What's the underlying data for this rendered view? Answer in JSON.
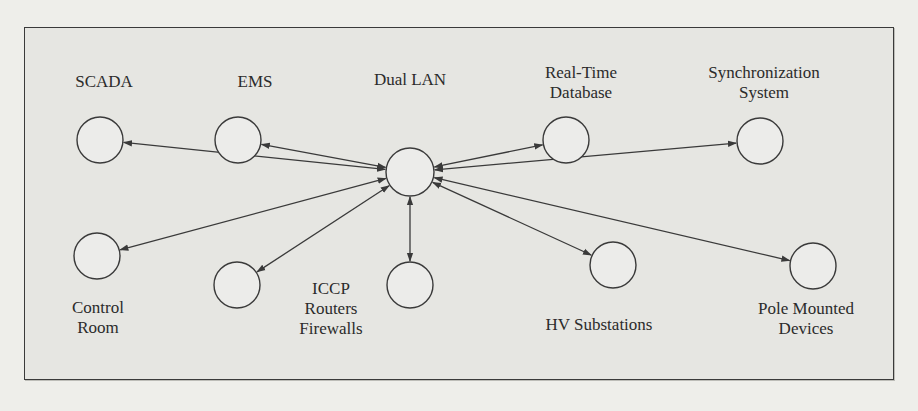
{
  "diagram": {
    "type": "network-star",
    "hub": {
      "id": "dual-lan",
      "label": "Dual LAN",
      "cx": 410,
      "cy": 172,
      "r": 24,
      "label_x": 410,
      "label_y": 70
    },
    "nodes": [
      {
        "id": "scada",
        "label": "SCADA",
        "cx": 100,
        "cy": 140,
        "r": 23,
        "label_x": 104,
        "label_y": 72
      },
      {
        "id": "ems",
        "label": "EMS",
        "cx": 238,
        "cy": 140,
        "r": 23,
        "label_x": 255,
        "label_y": 72
      },
      {
        "id": "real-time-database",
        "label": "Real-Time\nDatabase",
        "cx": 566,
        "cy": 140,
        "r": 23,
        "label_x": 581,
        "label_y": 63
      },
      {
        "id": "synchronization-system",
        "label": "Synchronization\nSystem",
        "cx": 760,
        "cy": 141,
        "r": 23,
        "label_x": 764,
        "label_y": 63
      },
      {
        "id": "control-room",
        "label": "Control\nRoom",
        "cx": 97,
        "cy": 256,
        "r": 23,
        "label_x": 98,
        "label_y": 298
      },
      {
        "id": "iccp-left",
        "label": "",
        "cx": 237,
        "cy": 285,
        "r": 23,
        "label_x": 237,
        "label_y": 0
      },
      {
        "id": "iccp-routers-firewalls",
        "label": "ICCP\nRouters\nFirewalls",
        "cx": 410,
        "cy": 285,
        "r": 23,
        "label_x": 331,
        "label_y": 279
      },
      {
        "id": "hv-substations",
        "label": "HV Substations",
        "cx": 613,
        "cy": 265,
        "r": 23,
        "label_x": 599,
        "label_y": 315
      },
      {
        "id": "pole-mounted-devices",
        "label": "Pole Mounted\nDevices",
        "cx": 813,
        "cy": 266,
        "r": 23,
        "label_x": 806,
        "label_y": 299
      }
    ],
    "edges": [
      {
        "from": "dual-lan",
        "to": "scada",
        "bidirectional": true
      },
      {
        "from": "dual-lan",
        "to": "ems",
        "bidirectional": true
      },
      {
        "from": "dual-lan",
        "to": "real-time-database",
        "bidirectional": true
      },
      {
        "from": "dual-lan",
        "to": "synchronization-system",
        "bidirectional": true
      },
      {
        "from": "dual-lan",
        "to": "control-room",
        "bidirectional": true
      },
      {
        "from": "dual-lan",
        "to": "iccp-left",
        "bidirectional": true
      },
      {
        "from": "dual-lan",
        "to": "iccp-routers-firewalls",
        "bidirectional": true
      },
      {
        "from": "dual-lan",
        "to": "hv-substations",
        "bidirectional": true
      },
      {
        "from": "dual-lan",
        "to": "pole-mounted-devices",
        "bidirectional": true
      }
    ],
    "colors": {
      "stroke": "#3a3a3a",
      "node_fill": "#ececea",
      "frame_bg": "#e6e6e2",
      "page_bg": "#eeeeea"
    }
  }
}
